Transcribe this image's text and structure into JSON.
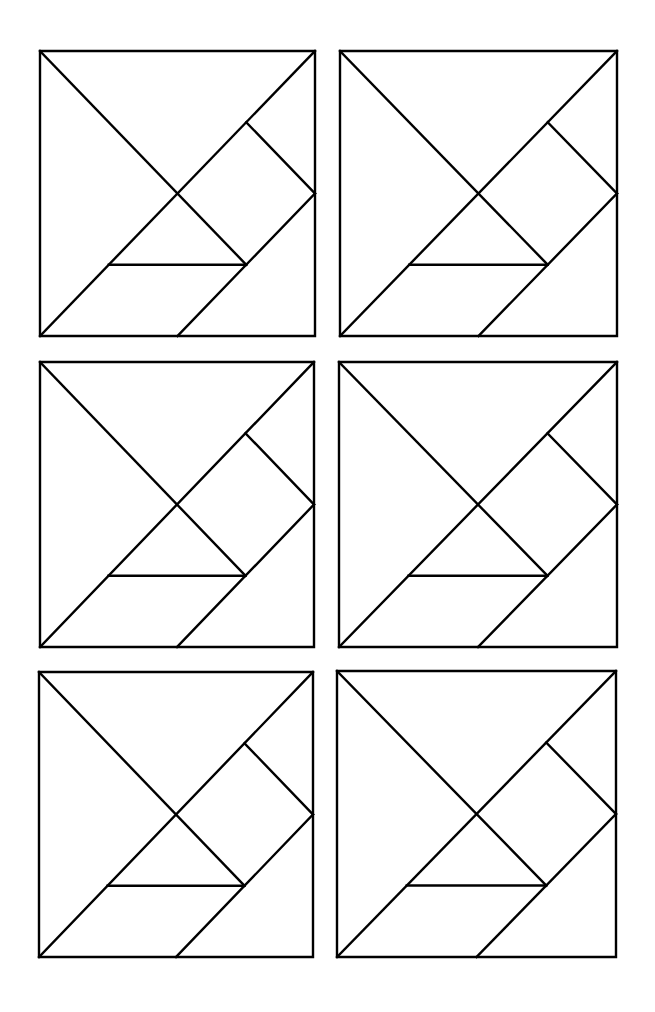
{
  "document": {
    "type": "tangram-template-worksheet",
    "layout": {
      "rows": 3,
      "columns": 2
    },
    "stroke_color": "#000000",
    "background_color": "#ffffff"
  },
  "tangrams": [
    {
      "id": "tangram-1",
      "row": 1,
      "col": 1,
      "x": 40,
      "y": 51,
      "w": 275,
      "h": 285
    },
    {
      "id": "tangram-2",
      "row": 1,
      "col": 2,
      "x": 340,
      "y": 51,
      "w": 277,
      "h": 285
    },
    {
      "id": "tangram-3",
      "row": 2,
      "col": 1,
      "x": 40,
      "y": 362,
      "w": 274,
      "h": 285
    },
    {
      "id": "tangram-4",
      "row": 2,
      "col": 2,
      "x": 339,
      "y": 362,
      "w": 278,
      "h": 285
    },
    {
      "id": "tangram-5",
      "row": 3,
      "col": 1,
      "x": 39,
      "y": 672,
      "w": 274,
      "h": 285
    },
    {
      "id": "tangram-6",
      "row": 3,
      "col": 2,
      "x": 337,
      "y": 671,
      "w": 279,
      "h": 286
    }
  ],
  "tangram_pieces": [
    {
      "name": "large-triangle-left",
      "description": "Large triangle on left edge"
    },
    {
      "name": "large-triangle-top",
      "description": "Large triangle on top edge"
    },
    {
      "name": "medium-triangle",
      "description": "Medium triangle in bottom-right corner"
    },
    {
      "name": "small-triangle-center",
      "description": "Small triangle below center"
    },
    {
      "name": "small-triangle-right",
      "description": "Small triangle on right edge"
    },
    {
      "name": "square",
      "description": "Square tilted 45 degrees, right of center"
    },
    {
      "name": "parallelogram",
      "description": "Parallelogram along bottom-left"
    }
  ],
  "tangram_lines": [
    {
      "name": "diagonal-top-left-to-center",
      "x1": 0,
      "y1": 0,
      "x2": 0.75,
      "y2": 0.75
    },
    {
      "name": "anti-diagonal",
      "x1": 0,
      "y1": 1,
      "x2": 1,
      "y2": 0
    },
    {
      "name": "square-upper-edge",
      "x1": 0.75,
      "y1": 0.25,
      "x2": 1,
      "y2": 0.5
    },
    {
      "name": "parallelogram-right-edge",
      "x1": 1,
      "y1": 0.5,
      "x2": 0.5,
      "y2": 1
    },
    {
      "name": "small-triangle-base",
      "x1": 0.25,
      "y1": 0.75,
      "x2": 0.75,
      "y2": 0.75
    }
  ]
}
